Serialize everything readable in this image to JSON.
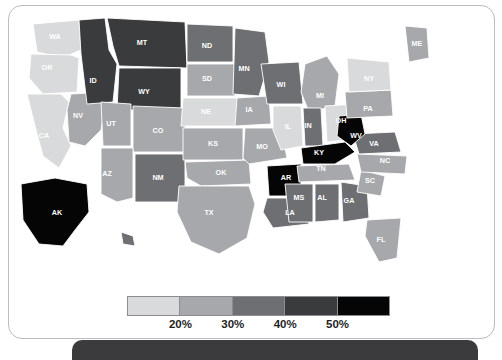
{
  "card": {
    "name": "us-choropleth-card"
  },
  "legend": {
    "name": "choropleth-legend",
    "ticks": [
      "20%",
      "30%",
      "40%",
      "50%"
    ],
    "colors": [
      "#d9dadb",
      "#a6a8ab",
      "#6d6f72",
      "#3a3b3d",
      "#050505"
    ]
  },
  "chart_data": {
    "type": "heatmap",
    "title": "",
    "subtitle": "",
    "xlabel": "",
    "ylabel": "",
    "legend_position": "bottom",
    "grid": false,
    "unit": "%",
    "bins": [
      {
        "label": "20%",
        "color": "#d9dadb"
      },
      {
        "label": "30%",
        "color": "#a6a8ab"
      },
      {
        "label": "40%",
        "color": "#6d6f72"
      },
      {
        "label": "50%",
        "color": "#3a3b3d"
      },
      {
        "label": "50%+",
        "color": "#050505"
      }
    ],
    "categories": [
      "WA",
      "OR",
      "CA",
      "NV",
      "ID",
      "MT",
      "WY",
      "UT",
      "CO",
      "AZ",
      "NM",
      "ND",
      "SD",
      "NE",
      "KS",
      "OK",
      "TX",
      "MN",
      "IA",
      "MO",
      "AR",
      "LA",
      "WI",
      "IL",
      "MI",
      "IN",
      "OH",
      "KY",
      "TN",
      "MS",
      "AL",
      "GA",
      "FL",
      "SC",
      "NC",
      "VA",
      "WV",
      "PA",
      "NY",
      "ME",
      "VT",
      "NH",
      "MA",
      "RI",
      "CT",
      "NJ",
      "DE",
      "MD",
      "AK",
      "HI"
    ],
    "values": [
      22,
      22,
      22,
      35,
      55,
      55,
      55,
      35,
      35,
      35,
      45,
      45,
      38,
      22,
      35,
      35,
      35,
      45,
      35,
      35,
      55,
      45,
      45,
      28,
      35,
      38,
      28,
      55,
      35,
      45,
      45,
      45,
      35,
      35,
      35,
      38,
      55,
      35,
      22,
      35,
      28,
      28,
      28,
      28,
      28,
      28,
      28,
      28,
      55,
      38
    ]
  },
  "map": {
    "name": "us-states-map",
    "states": [
      {
        "abbr": "WA",
        "x": 46,
        "y": 31,
        "tone": 1
      },
      {
        "abbr": "OR",
        "x": 38,
        "y": 62,
        "tone": 1
      },
      {
        "abbr": "CA",
        "x": 35,
        "y": 130,
        "tone": 1
      },
      {
        "abbr": "NV",
        "x": 69,
        "y": 110,
        "tone": 2
      },
      {
        "abbr": "ID",
        "x": 84,
        "y": 75,
        "tone": 4
      },
      {
        "abbr": "MT",
        "x": 133,
        "y": 37,
        "tone": 4
      },
      {
        "abbr": "WY",
        "x": 135,
        "y": 86,
        "tone": 4
      },
      {
        "abbr": "UT",
        "x": 102,
        "y": 118,
        "tone": 2
      },
      {
        "abbr": "CO",
        "x": 149,
        "y": 125,
        "tone": 2
      },
      {
        "abbr": "AZ",
        "x": 98,
        "y": 168,
        "tone": 2
      },
      {
        "abbr": "NM",
        "x": 149,
        "y": 172,
        "tone": 3
      },
      {
        "abbr": "ND",
        "x": 198,
        "y": 40,
        "tone": 3
      },
      {
        "abbr": "SD",
        "x": 198,
        "y": 73,
        "tone": 2
      },
      {
        "abbr": "NE",
        "x": 197,
        "y": 106,
        "tone": 1
      },
      {
        "abbr": "KS",
        "x": 204,
        "y": 138,
        "tone": 2
      },
      {
        "abbr": "OK",
        "x": 212,
        "y": 167,
        "tone": 2
      },
      {
        "abbr": "TX",
        "x": 200,
        "y": 207,
        "tone": 2
      },
      {
        "abbr": "MN",
        "x": 235,
        "y": 63,
        "tone": 3
      },
      {
        "abbr": "IA",
        "x": 240,
        "y": 104,
        "tone": 2
      },
      {
        "abbr": "MO",
        "x": 253,
        "y": 141,
        "tone": 2
      },
      {
        "abbr": "AR",
        "x": 277,
        "y": 172,
        "tone": 5
      },
      {
        "abbr": "LA",
        "x": 281,
        "y": 207,
        "tone": 3
      },
      {
        "abbr": "WI",
        "x": 272,
        "y": 79,
        "tone": 3
      },
      {
        "abbr": "IL",
        "x": 279,
        "y": 121,
        "tone": 1
      },
      {
        "abbr": "MI",
        "x": 311,
        "y": 90,
        "tone": 2
      },
      {
        "abbr": "IN",
        "x": 299,
        "y": 120,
        "tone": 3
      },
      {
        "abbr": "OH",
        "x": 332,
        "y": 115,
        "tone": 1
      },
      {
        "abbr": "KY",
        "x": 310,
        "y": 147,
        "tone": 5
      },
      {
        "abbr": "TN",
        "x": 312,
        "y": 163,
        "tone": 2
      },
      {
        "abbr": "MS",
        "x": 290,
        "y": 192,
        "tone": 3
      },
      {
        "abbr": "AL",
        "x": 313,
        "y": 192,
        "tone": 3
      },
      {
        "abbr": "GA",
        "x": 340,
        "y": 195,
        "tone": 3
      },
      {
        "abbr": "FL",
        "x": 372,
        "y": 234,
        "tone": 2
      },
      {
        "abbr": "SC",
        "x": 361,
        "y": 175,
        "tone": 2
      },
      {
        "abbr": "NC",
        "x": 376,
        "y": 155,
        "tone": 2
      },
      {
        "abbr": "VA",
        "x": 365,
        "y": 138,
        "tone": 3
      },
      {
        "abbr": "WV",
        "x": 347,
        "y": 130,
        "tone": 5
      },
      {
        "abbr": "PA",
        "x": 359,
        "y": 103,
        "tone": 2
      },
      {
        "abbr": "NY",
        "x": 360,
        "y": 73,
        "tone": 1
      },
      {
        "abbr": "ME",
        "x": 408,
        "y": 38,
        "tone": 2
      },
      {
        "abbr": "AK",
        "x": 48,
        "y": 207,
        "tone": 5
      },
      {
        "abbr": "HI",
        "x": 130,
        "y": 233,
        "tone": 3
      }
    ],
    "callouts": [
      {
        "abbr": "VT",
        "x": 428,
        "y": 58,
        "x1": 428,
        "y1": 58,
        "x2": 398,
        "y2": 58
      },
      {
        "abbr": "NH",
        "x": 428,
        "y": 69,
        "x1": 428,
        "y1": 69,
        "x2": 400,
        "y2": 66
      },
      {
        "abbr": "MA",
        "x": 428,
        "y": 80,
        "x1": 428,
        "y1": 80,
        "x2": 398,
        "y2": 75
      },
      {
        "abbr": "RI",
        "x": 428,
        "y": 91,
        "x1": 428,
        "y1": 91,
        "x2": 394,
        "y2": 82
      },
      {
        "abbr": "CT",
        "x": 428,
        "y": 102,
        "x1": 428,
        "y1": 102,
        "x2": 390,
        "y2": 86
      },
      {
        "abbr": "NJ",
        "x": 420,
        "y": 114,
        "x1": 420,
        "y1": 114,
        "x2": 386,
        "y2": 106
      },
      {
        "abbr": "DE",
        "x": 420,
        "y": 125,
        "x1": 420,
        "y1": 125,
        "x2": 381,
        "y2": 116
      },
      {
        "abbr": "MD",
        "x": 420,
        "y": 136,
        "x1": 420,
        "y1": 136,
        "x2": 372,
        "y2": 124
      },
      {
        "abbr": "NY",
        "x": 352,
        "y": 73,
        "x1": 0,
        "y1": 0,
        "x2": 0,
        "y2": 0
      }
    ]
  }
}
